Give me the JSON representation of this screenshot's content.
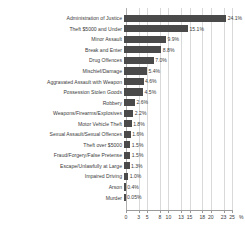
{
  "chart_data": {
    "type": "bar",
    "orientation": "horizontal",
    "title": "",
    "subtitle": "",
    "xlabel": "%",
    "ylabel": "",
    "xlim": [
      0,
      25
    ],
    "grid": true,
    "legend": false,
    "legend_position": "none",
    "bar_color": "#4a4a4a",
    "gridline_color": "#d9d9d9",
    "axis_color": "#9a9a9a",
    "text_color": "#3b3b3b",
    "background_color": "#ffffff",
    "xticks": [
      0,
      3,
      5,
      8,
      10,
      13,
      15,
      18,
      20,
      23,
      25
    ],
    "xticklabels": [
      "0",
      "3",
      "5",
      "8",
      "10",
      "13",
      "15",
      "18",
      "20",
      "23",
      "25"
    ],
    "axis_unit_label": "%",
    "categories": [
      "Administration of Justice",
      "Theft $5000 and Under",
      "Minor Assault",
      "Break and Enter",
      "Drug Offences",
      "Mischief/Damage",
      "Aggravated Assault with Weapon",
      "Possession Stolen Goods",
      "Robbery",
      "Weapons/Firearms/Explosives",
      "Motor Vehicle Theft",
      "Sexual Assault/Sexual Offences",
      "Theft over $5000",
      "Fraud/Forgery/False Pretense",
      "Escape/Unlawfully at Large",
      "Impaired Driving",
      "Arson",
      "Murder"
    ],
    "values": [
      24.1,
      15.1,
      9.9,
      8.8,
      7.0,
      5.4,
      4.6,
      4.5,
      2.6,
      2.2,
      1.8,
      1.6,
      1.5,
      1.5,
      1.3,
      1.0,
      0.4,
      0.05
    ],
    "value_labels": [
      "24.1%",
      "15.1%",
      "9.9%",
      "8.8%",
      "7.0%",
      "5.4%",
      "4.6%",
      "4.5%",
      "2.6%",
      "2.2%",
      "1.8%",
      "1.6%",
      "1.5%",
      "1.5%",
      "1.3%",
      "1.0%",
      "0.4%",
      "0.05%"
    ]
  }
}
